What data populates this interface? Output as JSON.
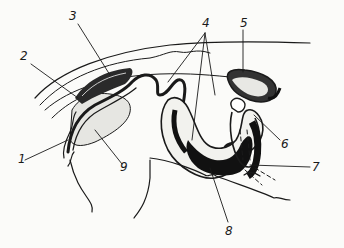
{
  "figure": {
    "type": "anatomical line drawing",
    "labels": [
      {
        "id": "1",
        "text": "1",
        "x": 18,
        "y": 159
      },
      {
        "id": "2",
        "text": "2",
        "x": 20,
        "y": 56
      },
      {
        "id": "3",
        "text": "3",
        "x": 69,
        "y": 11
      },
      {
        "id": "4",
        "text": "4",
        "x": 205,
        "y": 18
      },
      {
        "id": "5",
        "text": "5",
        "x": 241,
        "y": 18
      },
      {
        "id": "6",
        "text": "6",
        "x": 281,
        "y": 139
      },
      {
        "id": "7",
        "text": "7",
        "x": 311,
        "y": 160
      },
      {
        "id": "8",
        "text": "8",
        "x": 226,
        "y": 225
      },
      {
        "id": "9",
        "text": "9",
        "x": 121,
        "y": 161
      }
    ],
    "colors": {
      "ink": "#1a1a1a",
      "background": "#fbfbf9"
    }
  }
}
